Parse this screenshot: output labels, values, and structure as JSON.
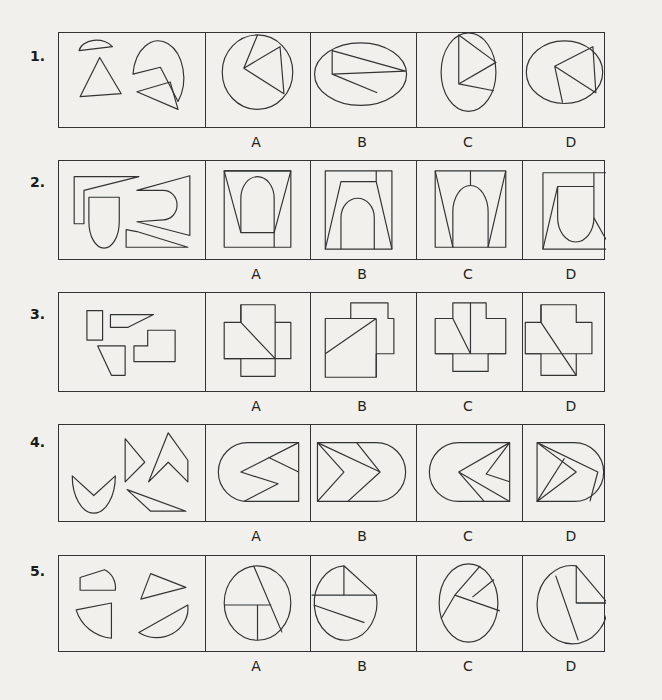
{
  "questions": [
    {
      "number": "1.",
      "options": [
        "A",
        "B",
        "C",
        "D"
      ],
      "prompt_desc": "semicircle, triangle, quadrilateral wedge, concave egg-shape piece"
    },
    {
      "number": "2.",
      "options": [
        "A",
        "B",
        "C",
        "D"
      ],
      "prompt_desc": "L-shape strip, arch/U shape, C-shaped piece, long thin wedge"
    },
    {
      "number": "3.",
      "options": [
        "A",
        "B",
        "C",
        "D"
      ],
      "prompt_desc": "rectangle, trapezoid strip, trapezoid, L-shaped stepped piece"
    },
    {
      "number": "4.",
      "options": [
        "A",
        "B",
        "C",
        "D"
      ],
      "prompt_desc": "V-crescent, triangle-notch, chevron, thin triangle"
    },
    {
      "number": "5.",
      "options": [
        "A",
        "B",
        "C",
        "D"
      ],
      "prompt_desc": "quarter-round pentagon, triangle, curved wedge, circular segment"
    }
  ]
}
